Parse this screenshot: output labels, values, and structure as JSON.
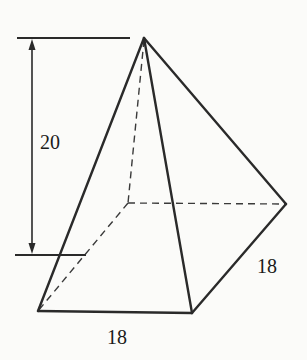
{
  "diagram": {
    "type": "square pyramid",
    "labels": {
      "height": "20",
      "base_front": "18",
      "base_side": "18"
    },
    "vertices": {
      "apex": [
        144,
        38
      ],
      "front_left": [
        38,
        311
      ],
      "front_right": [
        192,
        313
      ],
      "back_right": [
        286,
        204
      ],
      "back_left_hidden": [
        128,
        203
      ]
    },
    "colors": {
      "stroke": "#2a2a2a",
      "background": "#fbfbf9"
    }
  }
}
